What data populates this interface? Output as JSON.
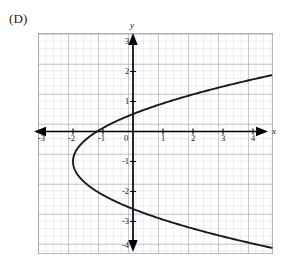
{
  "figure": {
    "choice_label": "(D)",
    "background_color": "#ffffff"
  },
  "axes": {
    "x_axis_name": "x",
    "y_axis_name": "y",
    "axis_color": "#000000",
    "minor_grid_color": "#c9c9d6",
    "major_grid_color": "#9a9aab",
    "x_tick_labels": [
      "-3",
      "-2",
      "-1",
      "0",
      "1",
      "2",
      "3",
      "4"
    ],
    "y_tick_labels": [
      "3",
      "2",
      "1",
      "-1",
      "-2",
      "-3",
      "-4"
    ]
  },
  "chart_data": {
    "type": "line",
    "title": "",
    "xlabel": "x",
    "ylabel": "y",
    "xlim": [
      -3.17,
      4.67
    ],
    "ylim": [
      -4.1,
      3.3
    ],
    "grid": true,
    "minor_grid_step": 0.25,
    "major_grid_step": 1,
    "legend": "none",
    "annotations": [
      "(D)"
    ],
    "curve": {
      "name": "rightward-opening parabola",
      "equation": "x = 0.8*(y + 1)^2 - 2",
      "vertex": [
        -2,
        -1
      ],
      "opens": "right",
      "stroke_color": "#1a1a1a",
      "stroke_width": 1.9,
      "y_samples": [
        -4.1,
        -3.8,
        -3.5,
        -3.2,
        -2.9,
        -2.6,
        -2.3,
        -2.0,
        -1.8,
        -1.6,
        -1.4,
        -1.2,
        -1.0,
        -0.8,
        -0.6,
        -0.4,
        -0.2,
        0.0,
        0.3,
        0.6,
        0.9,
        1.2,
        1.5,
        1.8,
        2.1
      ],
      "x_values": [
        5.69,
        4.7,
        3.8,
        2.99,
        2.26,
        1.62,
        1.07,
        0.8,
        0.51,
        0.29,
        0.13,
        0.03,
        -2.0,
        -1.97,
        -1.87,
        -1.71,
        -1.49,
        -1.2,
        -0.65,
        0.05,
        0.89,
        1.87,
        3.0,
        4.27,
        5.68
      ]
    }
  }
}
